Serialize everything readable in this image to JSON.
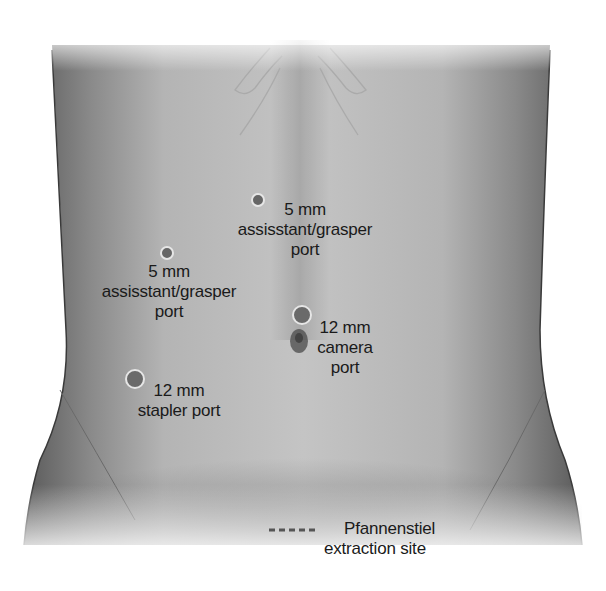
{
  "diagram": {
    "colors": {
      "skin_light": "#c8c8c8",
      "skin_mid": "#a8a8a8",
      "skin_dark": "#6e6e6e",
      "port_fill": "#6a6a6a",
      "port_ring": "#e6e6e6",
      "text": "#1a1a1a",
      "dash": "#555555"
    },
    "ports": [
      {
        "id": "upper-assistant",
        "size": "5 mm",
        "line1": "5 mm",
        "line2": "assisstant/grasper",
        "line3": "port"
      },
      {
        "id": "left-assistant",
        "size": "5 mm",
        "line1": "5 mm",
        "line2": "assisstant/grasper",
        "line3": "port"
      },
      {
        "id": "camera",
        "size": "12 mm",
        "line1": "12 mm",
        "line2": "camera",
        "line3": "port"
      },
      {
        "id": "stapler",
        "size": "12 mm",
        "line1": "12 mm",
        "line2": "stapler port"
      }
    ],
    "extraction": {
      "line1": "Pfannenstiel",
      "line2": "extraction site",
      "legend_style": "dashed line"
    }
  }
}
